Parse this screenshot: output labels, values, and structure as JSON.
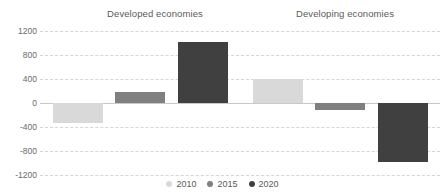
{
  "chart_data": {
    "type": "bar",
    "title": "",
    "subtitle": "",
    "xlabel": "",
    "ylabel": "",
    "categories": [
      "Developed economies",
      "Developing economies"
    ],
    "series": [
      {
        "name": "2010",
        "color": "#d9d9d9",
        "values": [
          -330,
          400
        ]
      },
      {
        "name": "2015",
        "color": "#808080",
        "values": [
          190,
          -120
        ]
      },
      {
        "name": "2020",
        "color": "#404040",
        "values": [
          1020,
          -980
        ]
      }
    ],
    "ylim": [
      -1200,
      1200
    ],
    "yticks": [
      1200,
      800,
      400,
      0,
      -400,
      -800,
      -1200
    ],
    "ytick_labels": [
      "1200",
      "800",
      "400",
      "0",
      "-400",
      "-800",
      "-1200"
    ],
    "grid": true,
    "grid_style": "dashed-horizontal",
    "legend_position": "bottom",
    "zero_line": 0
  },
  "legend": {
    "items": [
      {
        "label": "2010",
        "color": "#d9d9d9"
      },
      {
        "label": "2015",
        "color": "#808080"
      },
      {
        "label": "2020",
        "color": "#404040"
      }
    ]
  },
  "colors": {
    "gridline": "#d6d6d6",
    "zeroline": "#c9c9c9",
    "tick_text": "#6b6b6b",
    "title_text": "#5a5a5a",
    "background": "#ffffff"
  }
}
